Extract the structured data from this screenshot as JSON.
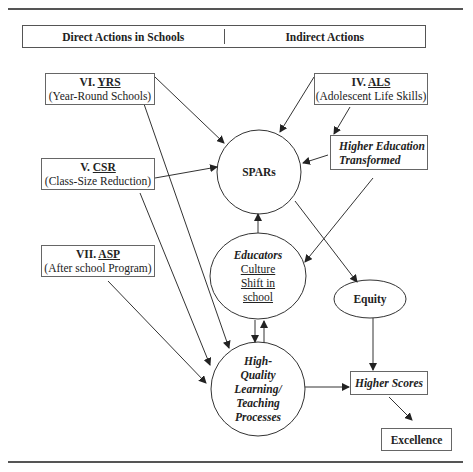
{
  "header": {
    "left": "Direct Actions in Schools",
    "right": "Indirect Actions"
  },
  "boxes": {
    "yrs": {
      "numeral": "VI.",
      "abbr": "YRS",
      "full": "(Year-Round Schools)"
    },
    "csr": {
      "numeral": "V.",
      "abbr": "CSR",
      "full": "(Class-Size Reduction)"
    },
    "asp": {
      "numeral": "VII.",
      "abbr": "ASP",
      "full": "(After school Program)"
    },
    "als": {
      "numeral": "IV.",
      "abbr": "ALS",
      "full": "(Adolescent Life Skills)"
    },
    "het": {
      "line1": "Higher Education",
      "line2": "Transformed"
    },
    "scores": {
      "label": "Higher Scores"
    },
    "excellence": {
      "label": "Excellence"
    }
  },
  "nodes": {
    "spars": {
      "label": "SPARs"
    },
    "educators": {
      "title": "Educators",
      "line1": "Culture",
      "line2": "Shift in",
      "line3": "school"
    },
    "hql": {
      "line1": "High-",
      "line2": "Quality",
      "line3": "Learning/",
      "line4": "Teaching",
      "line5": "Processes"
    },
    "equity": {
      "label": "Equity"
    }
  },
  "edges": [
    [
      "YRS",
      "SPARs"
    ],
    [
      "CSR",
      "SPARs"
    ],
    [
      "ALS",
      "SPARs"
    ],
    [
      "HET",
      "SPARs"
    ],
    [
      "ALS",
      "HET"
    ],
    [
      "HET",
      "Educators"
    ],
    [
      "Educators",
      "SPARs"
    ],
    [
      "Educators",
      "HQL"
    ],
    [
      "HQL",
      "Educators"
    ],
    [
      "YRS",
      "HQL"
    ],
    [
      "CSR",
      "HQL"
    ],
    [
      "ASP",
      "HQL"
    ],
    [
      "SPARs",
      "Equity"
    ],
    [
      "Equity",
      "Higher Scores"
    ],
    [
      "HQL",
      "Higher Scores"
    ],
    [
      "Higher Scores",
      "Excellence"
    ]
  ]
}
